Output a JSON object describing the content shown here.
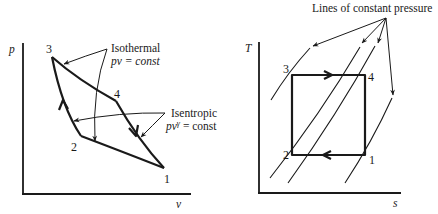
{
  "left_diagram": {
    "title": "p-v diagram (Carnot cycle)",
    "y_axis_label": "p",
    "x_axis_label": "v",
    "state_points": [
      {
        "id": "1",
        "label": "1"
      },
      {
        "id": "2",
        "label": "2"
      },
      {
        "id": "3",
        "label": "3"
      },
      {
        "id": "4",
        "label": "4"
      }
    ],
    "annotations": {
      "isothermal": {
        "title": "Isothermal",
        "formula": "pv = const"
      },
      "isentropic": {
        "title": "Isentropic",
        "formula_base": "pv",
        "formula_exp": "γ",
        "formula_rest": " = const"
      }
    }
  },
  "right_diagram": {
    "title": "T-s diagram (Carnot cycle)",
    "y_axis_label": "T",
    "x_axis_label": "s",
    "state_points": [
      {
        "id": "1",
        "label": "1"
      },
      {
        "id": "2",
        "label": "2"
      },
      {
        "id": "3",
        "label": "3"
      },
      {
        "id": "4",
        "label": "4"
      }
    ],
    "annotation": "Lines of constant pressure",
    "constant_pressure_line_count": 4
  },
  "colors": {
    "ink": "#1a1a1a",
    "background": "#ffffff"
  }
}
